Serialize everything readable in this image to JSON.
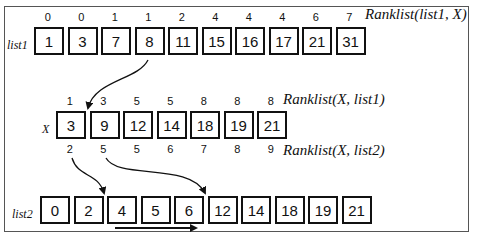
{
  "lists": {
    "list1": {
      "name": "list1",
      "values": [
        "1",
        "3",
        "7",
        "8",
        "11",
        "15",
        "16",
        "17",
        "21",
        "31"
      ],
      "ranks": [
        "0",
        "0",
        "1",
        "1",
        "2",
        "4",
        "4",
        "4",
        "6",
        "7"
      ],
      "rank_caption": "Ranklist(list1, X)"
    },
    "X": {
      "name": "X",
      "values": [
        "3",
        "9",
        "12",
        "14",
        "18",
        "19",
        "21"
      ],
      "ranks_top": [
        "1",
        "3",
        "5",
        "5",
        "8",
        "8",
        "8"
      ],
      "top_caption": "Ranklist(X, list1)",
      "ranks_bottom": [
        "2",
        "5",
        "5",
        "6",
        "7",
        "8",
        "9"
      ],
      "bottom_caption": "Ranklist(X, list2)"
    },
    "list2": {
      "name": "list2",
      "values": [
        "0",
        "2",
        "4",
        "5",
        "6",
        "12",
        "14",
        "18",
        "19",
        "21"
      ]
    }
  },
  "colors": {
    "stroke": "#111111",
    "frame": "#555555"
  }
}
